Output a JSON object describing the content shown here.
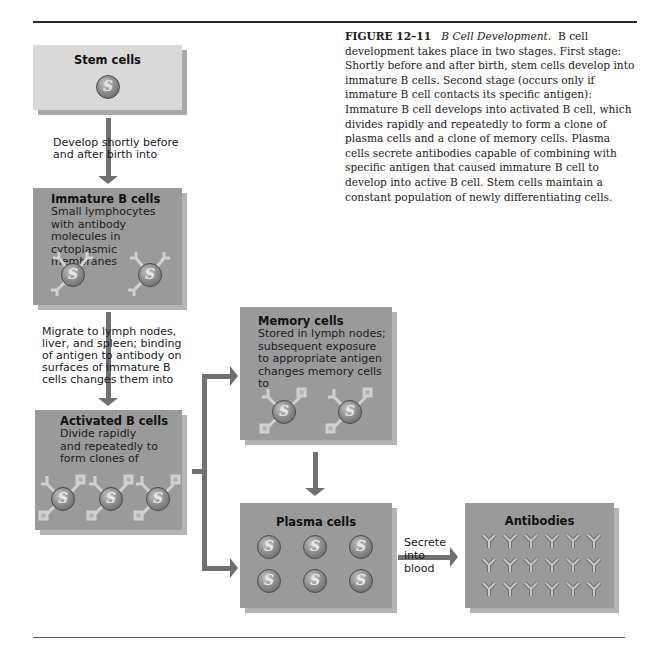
{
  "caption": {
    "figure_number": "FIGURE 12–11",
    "figure_title": "B Cell Development.",
    "body": "B cell development takes place in two stages. First stage: Shortly before and after birth, stem cells develop into immature B cells. Second stage (occurs only if immature B cell contacts its specific antigen): Immature B cell develops into activated B cell, which divides rapidly and repeatedly to form a clone of plasma cells and a clone of memory cells. Plasma cells secrete antibodies capable of combining with specific antigen that caused immature B cell to develop into active B cell. Stem cells maintain a constant population of newly differentiating cells."
  },
  "boxes": {
    "stem": {
      "title": "Stem cells",
      "icon": "stem-cell-icon",
      "cell_count": 1,
      "color": "#d9d9d9"
    },
    "immature": {
      "title": "Immature B cells",
      "text": "Small lymphocytes with antibody molecules in cytoplasmic membranes",
      "icon": "b-cell-with-antibody-icon",
      "cell_count": 2,
      "color": "#9a9a9a"
    },
    "activated": {
      "title": "Activated B cells",
      "text": "Divide rapidly and repeatedly to form clones of",
      "icon": "b-cell-with-antibody-icon",
      "cell_count": 3,
      "color": "#9a9a9a"
    },
    "memory": {
      "title": "Memory cells",
      "text": "Stored in lymph nodes; subsequent exposure to appropriate antigen changes memory cells to",
      "icon": "b-cell-with-antibody-icon",
      "cell_count": 2,
      "color": "#9a9a9a"
    },
    "plasma": {
      "title": "Plasma cells",
      "icon": "plasma-cell-icon",
      "cell_count": 6,
      "color": "#9a9a9a"
    },
    "antibodies": {
      "title": "Antibodies",
      "icon": "antibody-y-icon",
      "count": 18,
      "rows": 3,
      "cols": 6,
      "color": "#9a9a9a"
    }
  },
  "arrows": {
    "stem_to_immature": "Develop shortly before and after birth into",
    "immature_to_activated": "Migrate to lymph nodes, liver, and spleen; binding of antigen to antibody on surfaces of immature B cells changes them into",
    "plasma_to_antibodies": "Secrete into blood"
  },
  "colors": {
    "arrow": "#707070",
    "light_box": "#d9d9d9",
    "dark_box": "#9a9a9a",
    "shadow": "#a9a9a9"
  }
}
